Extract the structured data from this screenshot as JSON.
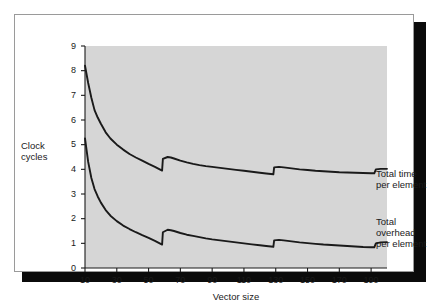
{
  "figure": {
    "background": "#ffffff",
    "plot_background": "#d6d6d6",
    "line_color": "#1a1a1a",
    "frame_color": "#9a9a9a",
    "shadow_color": "#0b0b0b"
  },
  "chart_data": {
    "type": "line",
    "title": "",
    "xlabel": "Vector size",
    "ylabel": "Clock cycles",
    "ylabel_lines": [
      "Clock",
      "cycles"
    ],
    "xlim": [
      10,
      200
    ],
    "ylim": [
      0,
      9
    ],
    "grid": false,
    "legend_position": "right-inline",
    "xticks": [
      10,
      30,
      50,
      70,
      90,
      110,
      130,
      150,
      170,
      190
    ],
    "yticks": [
      0,
      1,
      2,
      3,
      4,
      5,
      6,
      7,
      8,
      9
    ],
    "xtick_labels": [
      "10",
      "30",
      "50",
      "70",
      "90",
      "110",
      "130",
      "150",
      "170",
      "190"
    ],
    "ytick_labels": [
      "0",
      "1",
      "2",
      "3",
      "4",
      "5",
      "6",
      "7",
      "8",
      "9"
    ],
    "annotations": [
      {
        "text": "Total time per element",
        "lines": [
          "Total time",
          "per element"
        ],
        "x": 200,
        "y": 4.0
      },
      {
        "text": "Total overhead per element",
        "lines": [
          "Total",
          "overhead",
          "per element"
        ],
        "x": 200,
        "y": 1.0
      }
    ],
    "series": [
      {
        "name": "Total time per element",
        "label_lines": [
          "Total time",
          "per element"
        ],
        "x": [
          10,
          12,
          14,
          16,
          18,
          20,
          23,
          26,
          30,
          34,
          38,
          42,
          46,
          50,
          54,
          57,
          58.5,
          59,
          62,
          64,
          66,
          70,
          74,
          78,
          82,
          86,
          90,
          95,
          100,
          105,
          110,
          115,
          120,
          124,
          127,
          128.5,
          129,
          132,
          135,
          140,
          145,
          150,
          155,
          160,
          165,
          170,
          175,
          180,
          185,
          190,
          192,
          193,
          196,
          200
        ],
        "values": [
          8.2,
          7.5,
          6.9,
          6.4,
          6.1,
          5.85,
          5.5,
          5.25,
          5.0,
          4.8,
          4.62,
          4.48,
          4.35,
          4.22,
          4.1,
          4.0,
          3.95,
          4.42,
          4.5,
          4.48,
          4.44,
          4.35,
          4.28,
          4.22,
          4.17,
          4.13,
          4.1,
          4.06,
          4.02,
          3.98,
          3.94,
          3.9,
          3.86,
          3.83,
          3.81,
          3.8,
          4.08,
          4.1,
          4.08,
          4.04,
          4.0,
          3.97,
          3.94,
          3.92,
          3.9,
          3.88,
          3.87,
          3.86,
          3.85,
          3.84,
          3.84,
          4.0,
          4.02,
          4.02
        ]
      },
      {
        "name": "Total overhead per element",
        "label_lines": [
          "Total",
          "overhead",
          "per element"
        ],
        "x": [
          10,
          12,
          14,
          16,
          18,
          20,
          23,
          26,
          30,
          34,
          38,
          42,
          46,
          50,
          54,
          57,
          58.5,
          59,
          62,
          64,
          66,
          70,
          74,
          78,
          82,
          86,
          90,
          95,
          100,
          105,
          110,
          115,
          120,
          124,
          127,
          128.5,
          129,
          132,
          135,
          140,
          145,
          150,
          155,
          160,
          165,
          170,
          175,
          180,
          185,
          190,
          192,
          193,
          196,
          200
        ],
        "values": [
          5.25,
          4.3,
          3.65,
          3.2,
          2.9,
          2.65,
          2.35,
          2.12,
          1.9,
          1.72,
          1.58,
          1.45,
          1.33,
          1.22,
          1.1,
          1.0,
          0.95,
          1.45,
          1.55,
          1.53,
          1.5,
          1.42,
          1.35,
          1.3,
          1.25,
          1.2,
          1.16,
          1.12,
          1.08,
          1.04,
          1.0,
          0.96,
          0.92,
          0.89,
          0.87,
          0.86,
          1.12,
          1.14,
          1.12,
          1.08,
          1.04,
          1.01,
          0.98,
          0.95,
          0.93,
          0.91,
          0.89,
          0.87,
          0.85,
          0.84,
          0.84,
          1.0,
          1.04,
          1.05
        ]
      }
    ]
  }
}
